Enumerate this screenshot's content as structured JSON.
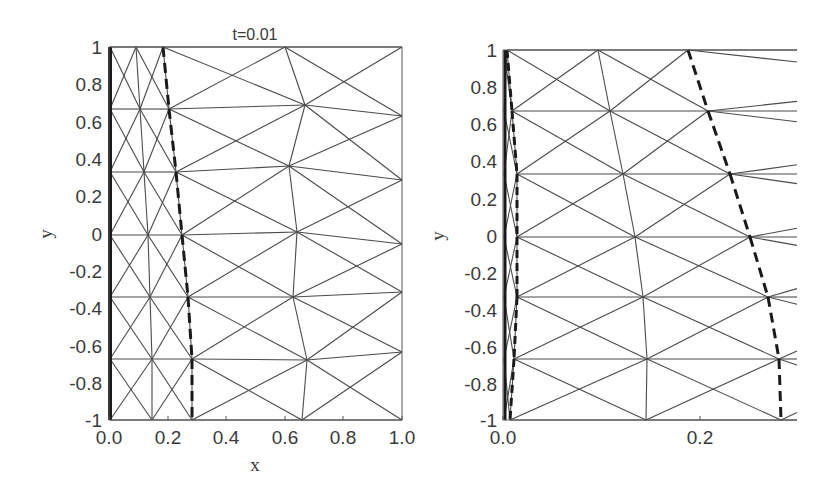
{
  "chart_data": [
    {
      "type": "mesh",
      "title": "t=0.01",
      "xlabel": "x",
      "ylabel": "y",
      "xlim": [
        0.0,
        1.0
      ],
      "ylim": [
        -1,
        1
      ],
      "xticks": [
        "0.0",
        "0.2",
        "0.4",
        "0.6",
        "0.8",
        "1.0"
      ],
      "yticks": [
        "1",
        "0.8",
        "0.6",
        "0.4",
        "0.2",
        "0",
        "-0.2",
        "-0.4",
        "-0.6",
        "-0.8",
        "-1"
      ],
      "grid": false,
      "description": "Triangular finite-element mesh on unit domain; bold solid line at x=0 and dashed moving front near x≈0.2–0.28",
      "front_curve_x": [
        0.18,
        0.2,
        0.23,
        0.25,
        0.27,
        0.28,
        0.28
      ],
      "front_curve_y": [
        1,
        0.667,
        0.333,
        0,
        -0.333,
        -0.667,
        -1
      ]
    },
    {
      "type": "mesh",
      "title": "",
      "xlabel": "",
      "ylabel": "y",
      "xlim": [
        0.0,
        0.3
      ],
      "ylim": [
        -1,
        1
      ],
      "xticks": [
        "0.0",
        "0.2"
      ],
      "yticks": [
        "1",
        "0.8",
        "0.6",
        "0.4",
        "0.2",
        "0",
        "-0.2",
        "-0.4",
        "-0.6",
        "-0.8",
        "-1"
      ],
      "grid": false,
      "description": "Zoomed mesh near the left boundary showing thin elements near x=0 and a curved dashed front near x≈0.19–0.28",
      "front_curve_x": [
        0.188,
        0.208,
        0.23,
        0.25,
        0.268,
        0.279,
        0.281
      ],
      "front_curve_y": [
        1,
        0.667,
        0.333,
        0,
        -0.333,
        -0.667,
        -1
      ]
    }
  ],
  "panels": {
    "left": {
      "title": "t=0.01",
      "xlabel": "x",
      "ylabel": "y",
      "frame": [
        109,
        47,
        402,
        420
      ],
      "xticks": [
        {
          "label": "0.0",
          "px": 109
        },
        {
          "label": "0.2",
          "px": 168
        },
        {
          "label": "0.4",
          "px": 226
        },
        {
          "label": "0.6",
          "px": 285
        },
        {
          "label": "0.8",
          "px": 343
        },
        {
          "label": "1.0",
          "px": 402
        }
      ],
      "yticks": [
        {
          "label": "1",
          "py": 47
        },
        {
          "label": "0.8",
          "py": 84
        },
        {
          "label": "0.6",
          "py": 122
        },
        {
          "label": "0.4",
          "py": 159
        },
        {
          "label": "0.2",
          "py": 196
        },
        {
          "label": "0",
          "py": 234
        },
        {
          "label": "-0.2",
          "py": 271
        },
        {
          "label": "-0.4",
          "py": 308
        },
        {
          "label": "-0.6",
          "py": 346
        },
        {
          "label": "-0.8",
          "py": 383
        },
        {
          "label": "-1",
          "py": 420
        }
      ],
      "nodes": {
        "A": [
          [
            110,
            47
          ],
          [
            110,
            109
          ],
          [
            110,
            172
          ],
          [
            110,
            235
          ],
          [
            110,
            297
          ],
          [
            110,
            359
          ],
          [
            110,
            420
          ]
        ],
        "B": [
          [
            136,
            47
          ],
          [
            140,
            109
          ],
          [
            144,
            172
          ],
          [
            148,
            235
          ],
          [
            150,
            297
          ],
          [
            152,
            359
          ],
          [
            152,
            420
          ]
        ],
        "C": [
          [
            163,
            47
          ],
          [
            169,
            109
          ],
          [
            176,
            172
          ],
          [
            182,
            235
          ],
          [
            188,
            297
          ],
          [
            192,
            359
          ],
          [
            192,
            420
          ]
        ],
        "D": [
          [
            285,
            47
          ],
          [
            305,
            105
          ],
          [
            289,
            166
          ],
          [
            297,
            232
          ],
          [
            293,
            297
          ],
          [
            307,
            360
          ],
          [
            302,
            420
          ]
        ],
        "E": [
          [
            402,
            47
          ],
          [
            402,
            116
          ],
          [
            402,
            180
          ],
          [
            402,
            244
          ],
          [
            402,
            292
          ],
          [
            402,
            352
          ],
          [
            402,
            420
          ]
        ]
      }
    },
    "right": {
      "ylabel": "y",
      "frame": [
        503,
        50,
        797,
        420
      ],
      "xticks": [
        {
          "label": "0.0",
          "px": 503
        },
        {
          "label": "0.2",
          "px": 700
        }
      ],
      "yticks": [
        {
          "label": "1",
          "py": 50
        },
        {
          "label": "0.8",
          "py": 87
        },
        {
          "label": "0.6",
          "py": 124
        },
        {
          "label": "0.4",
          "py": 161
        },
        {
          "label": "0.2",
          "py": 199
        },
        {
          "label": "0",
          "py": 236
        },
        {
          "label": "-0.2",
          "py": 273
        },
        {
          "label": "-0.4",
          "py": 310
        },
        {
          "label": "-0.6",
          "py": 347
        },
        {
          "label": "-0.8",
          "py": 384
        },
        {
          "label": "-1",
          "py": 420
        }
      ],
      "nodes": {
        "A": [
          [
            504,
            50
          ],
          [
            504,
            111
          ],
          [
            504,
            174
          ],
          [
            504,
            237
          ],
          [
            504,
            297
          ],
          [
            504,
            359
          ],
          [
            504,
            420
          ]
        ],
        "B": [
          [
            507,
            50
          ],
          [
            512,
            111
          ],
          [
            517,
            174
          ],
          [
            517,
            237
          ],
          [
            517,
            297
          ],
          [
            514,
            359
          ],
          [
            510,
            420
          ]
        ],
        "C": [
          [
            598,
            50
          ],
          [
            610,
            111
          ],
          [
            623,
            174
          ],
          [
            635,
            237
          ],
          [
            643,
            297
          ],
          [
            647,
            359
          ],
          [
            646,
            420
          ]
        ],
        "D": [
          [
            688,
            50
          ],
          [
            708,
            111
          ],
          [
            730,
            174
          ],
          [
            750,
            237
          ],
          [
            768,
            297
          ],
          [
            779,
            359
          ],
          [
            781,
            420
          ]
        ]
      },
      "right_edge_x": 797
    }
  },
  "colors": {
    "mesh_line": "#4a4a4a",
    "front_line": "#1a1a1a",
    "text": "#3a3a3a",
    "background": "#ffffff"
  }
}
